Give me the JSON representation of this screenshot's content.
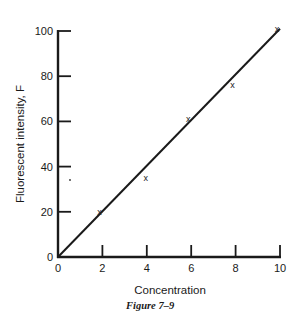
{
  "chart_data": {
    "type": "scatter",
    "title": "",
    "caption": "Figure 7–9",
    "xlabel": "Concentration",
    "ylabel": "Fluorescent intensity, F",
    "xlim": [
      0,
      10
    ],
    "ylim": [
      0,
      100
    ],
    "x_ticks": [
      0,
      2,
      4,
      6,
      8,
      10
    ],
    "y_ticks": [
      0,
      20,
      40,
      60,
      80,
      100
    ],
    "grid": false,
    "legend": null,
    "series": [
      {
        "name": "measured",
        "style": "x-markers",
        "x": [
          2,
          4,
          6,
          8,
          10
        ],
        "y": [
          20,
          35,
          61,
          76,
          101
        ]
      },
      {
        "name": "fit line",
        "style": "line",
        "x": [
          0,
          10
        ],
        "y": [
          0,
          101
        ]
      }
    ]
  },
  "labels": {
    "xlabel": "Concentration",
    "ylabel": "Fluorescent intensity, F",
    "caption": "Figure 7–9",
    "marker_glyph": "x"
  },
  "colors": {
    "ink": "#1a1a1a",
    "background": "#ffffff"
  }
}
